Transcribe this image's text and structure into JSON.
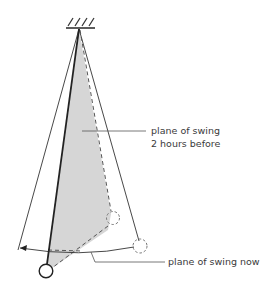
{
  "diagram": {
    "type": "foucault-pendulum",
    "labels": {
      "before_line1": "plane of swing",
      "before_line2": "2 hours before",
      "now": "plane of swing now"
    },
    "colors": {
      "shade": "#d6d6d6",
      "line": "#333333",
      "dashed": "#555555",
      "text": "#3a3a3a"
    }
  }
}
